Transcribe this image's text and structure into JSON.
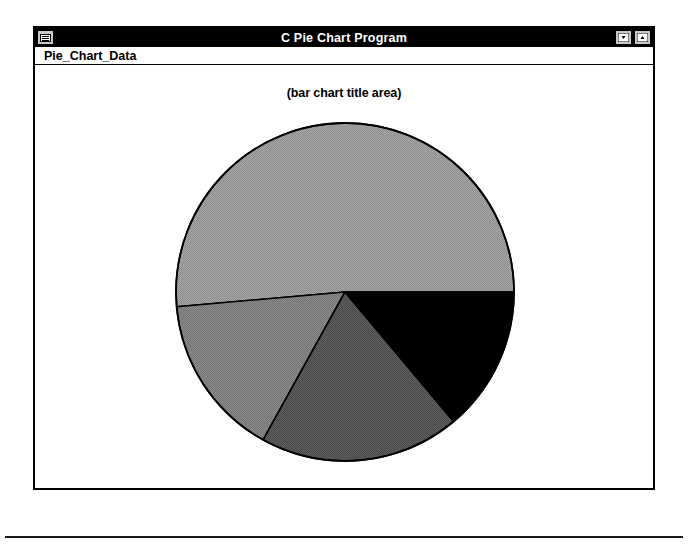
{
  "window": {
    "title": "C Pie Chart Program",
    "sys_menu_icon": "system-menu-icon",
    "minimize_icon": "minimize-icon",
    "maximize_icon": "maximize-icon"
  },
  "menu": {
    "items": [
      {
        "label": "Pie_Chart_Data"
      }
    ]
  },
  "chart_data": {
    "type": "pie",
    "title": "(bar chart title area)",
    "xlabel": "",
    "ylabel": "",
    "legend": "none",
    "grid": false,
    "center": {
      "x": 345,
      "y": 290
    },
    "radius": 169,
    "start_angle_deg": 0,
    "direction": "counterclockwise",
    "categories": [
      "Slice 1",
      "Slice 2",
      "Slice 3",
      "Slice 4"
    ],
    "values": [
      51.4,
      15.7,
      19.2,
      13.7
    ],
    "slices": [
      {
        "name": "Slice 1",
        "percent": 51.4,
        "angle_deg": 185,
        "start_deg": 0,
        "end_deg": 185,
        "color": "#9a9a9a",
        "shade": "light-gray"
      },
      {
        "name": "Slice 2",
        "percent": 15.7,
        "angle_deg": 56,
        "start_deg": 185,
        "end_deg": 241,
        "color": "#808080",
        "shade": "medium-gray"
      },
      {
        "name": "Slice 3",
        "percent": 19.2,
        "angle_deg": 69,
        "start_deg": 241,
        "end_deg": 310,
        "color": "#555555",
        "shade": "dark-gray"
      },
      {
        "name": "Slice 4",
        "percent": 13.7,
        "angle_deg": 50,
        "start_deg": 310,
        "end_deg": 360,
        "color": "#000000",
        "shade": "black"
      }
    ],
    "outline_color": "#000000"
  },
  "colors": {
    "title_bar_bg": "#000000",
    "title_bar_fg": "#ffffff",
    "window_bg": "#ffffff",
    "frame": "#000000",
    "button_face": "#c8c8c8"
  }
}
